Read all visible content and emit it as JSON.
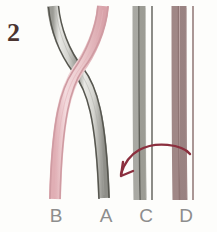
{
  "figure": {
    "step_number": "2",
    "kind": "braiding-step-diagram",
    "background_color": "#fdfdfb"
  },
  "labels": [
    {
      "name": "label-b",
      "text": "B",
      "x": 56,
      "color": "#8d8d8d"
    },
    {
      "name": "label-a",
      "text": "A",
      "x": 106,
      "color": "#8d8d8d"
    },
    {
      "name": "label-c",
      "text": "C",
      "x": 146,
      "color": "#8d8d8d"
    },
    {
      "name": "label-d",
      "text": "D",
      "x": 186,
      "color": "#8d8d8d"
    }
  ],
  "strands": [
    {
      "id": "strand-pink",
      "label_bottom": "B",
      "fill_color": "#eecbce",
      "edge_color": "#cf9ba2",
      "top_x": 101,
      "bottom_x": 56,
      "crosses": "over"
    },
    {
      "id": "strand-gray",
      "label_bottom": "A",
      "fill_color": "#dcdcd8",
      "edge_color": "#56564f",
      "top_x": 55,
      "bottom_x": 106,
      "crosses": "under"
    },
    {
      "id": "strand-c",
      "label_bottom": "C",
      "fill_color": "#e6e6e2",
      "edge_color": "#56564f",
      "top_x": 146,
      "bottom_x": 146,
      "crosses": "none"
    },
    {
      "id": "strand-d",
      "label_bottom": "D",
      "fill_color": "#cbb3b3",
      "edge_color": "#97807f",
      "top_x": 186,
      "bottom_x": 186,
      "crosses": "none"
    }
  ],
  "arrow": {
    "name": "move-arrow",
    "color": "#8b2f3e",
    "direction": "right-to-left",
    "from_strand": "D",
    "to_strand": "C",
    "start_x": 190,
    "start_y": 153,
    "end_x": 122,
    "end_y": 176
  },
  "crossing": {
    "x": 78,
    "y": 70,
    "over_strand": "strand-pink",
    "under_strand": "strand-gray"
  }
}
